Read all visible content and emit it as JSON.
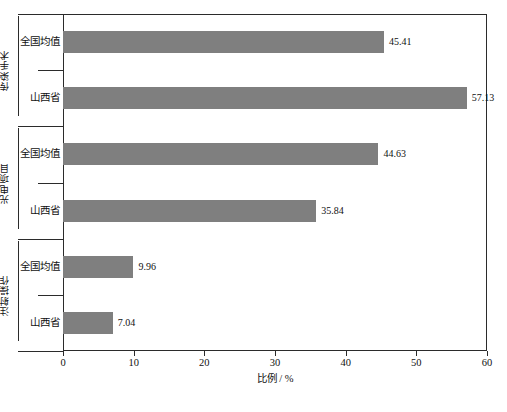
{
  "chart_data": {
    "type": "bar",
    "orientation": "horizontal",
    "title": "",
    "xlabel": "比例 / %",
    "ylabel": "",
    "xlim": [
      0,
      60
    ],
    "xticks": [
      0,
      10,
      20,
      30,
      40,
      50,
      60
    ],
    "grid": false,
    "legend": false,
    "bar_color": "#7f7f7f",
    "axis_color": "#2b2b2b",
    "groups": [
      {
        "label": "传染手术",
        "bars": [
          {
            "category": "全国均值",
            "value": 45.41,
            "value_label": "45.41"
          },
          {
            "category": "山西省",
            "value": 57.13,
            "value_label": "57.13"
          }
        ]
      },
      {
        "label": "光电项目",
        "bars": [
          {
            "category": "全国均值",
            "value": 44.63,
            "value_label": "44.63"
          },
          {
            "category": "山西省",
            "value": 35.84,
            "value_label": "35.84"
          }
        ]
      },
      {
        "label": "注射操作",
        "bars": [
          {
            "category": "全国均值",
            "value": 9.96,
            "value_label": "9.96"
          },
          {
            "category": "山西省",
            "value": 7.04,
            "value_label": "7.04"
          }
        ]
      }
    ]
  },
  "caption": ""
}
